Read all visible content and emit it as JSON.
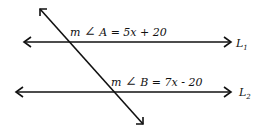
{
  "diagram": {
    "lines": [
      {
        "name": "L",
        "subscript": "1"
      },
      {
        "name": "L",
        "subscript": "2"
      }
    ],
    "angles": [
      {
        "label": "m",
        "symbol": "∠",
        "name": "A",
        "expression": "= 5x + 20"
      },
      {
        "label": "m",
        "symbol": "∠",
        "name": "B",
        "expression": "= 7x - 20"
      }
    ]
  }
}
